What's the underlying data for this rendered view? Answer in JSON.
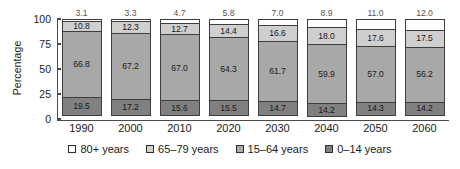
{
  "chart_data": {
    "type": "bar",
    "stacked": true,
    "title": "",
    "xlabel": "",
    "ylabel": "Percentage",
    "ylim": [
      0,
      100
    ],
    "yticks": [
      "0",
      "25",
      "50",
      "75",
      "100"
    ],
    "grid": false,
    "legend_position": "bottom",
    "categories": [
      "1990",
      "2000",
      "2010",
      "2020",
      "2030",
      "2040",
      "2050",
      "2060"
    ],
    "series": [
      {
        "name": "0–14 years",
        "color": "#808080",
        "values": [
          19.5,
          17.2,
          15.6,
          15.5,
          14.7,
          14.2,
          14.3,
          14.2
        ]
      },
      {
        "name": "15–64 years",
        "color": "#a8a8a8",
        "values": [
          66.8,
          67.2,
          67.0,
          64.3,
          61.7,
          59.9,
          57.0,
          56.2
        ]
      },
      {
        "name": "65–79 years",
        "color": "#cfcfcf",
        "values": [
          10.8,
          12.3,
          12.7,
          14.4,
          16.6,
          18.0,
          17.6,
          17.5
        ]
      },
      {
        "name": "80+ years",
        "color": "#ffffff",
        "values": [
          3.1,
          3.3,
          4.7,
          5.8,
          7.0,
          8.9,
          11.0,
          12.0
        ]
      }
    ]
  },
  "axis": {
    "ylabel": "Percentage",
    "ticks": [
      {
        "label": "100",
        "value": 100
      },
      {
        "label": "75",
        "value": 75
      },
      {
        "label": "50",
        "value": 50
      },
      {
        "label": "25",
        "value": 25
      },
      {
        "label": "0",
        "value": 0
      }
    ]
  },
  "legend": {
    "items": [
      {
        "label": "80+ years",
        "color": "#ffffff"
      },
      {
        "label": "65–79 years",
        "color": "#cfcfcf"
      },
      {
        "label": "15–64 years",
        "color": "#a8a8a8"
      },
      {
        "label": "0–14 years",
        "color": "#808080"
      }
    ]
  }
}
